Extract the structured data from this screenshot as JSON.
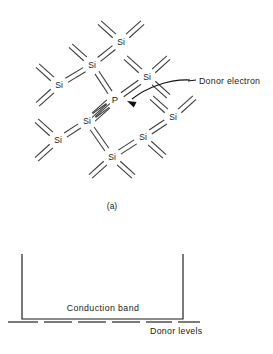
{
  "figure": {
    "panel_a": {
      "caption": "(a)",
      "caption_pos": {
        "x": 112,
        "y": 209
      },
      "annotation": {
        "label": "Donor electron",
        "text_pos": {
          "x": 199,
          "y": 84
        },
        "leader_line": {
          "x1": 188,
          "y1": 81,
          "x2": 196,
          "y2": 80
        },
        "arrow_path": "M 190 80 C 168 79 146 88 132 99",
        "arrow_tip": {
          "x": 127,
          "y": 101
        },
        "arrow_angle_deg": 205
      },
      "atoms": [
        {
          "id": "si-top",
          "label": "Si",
          "x": 121,
          "y": 42,
          "element": "silicon"
        },
        {
          "id": "si-upper-left",
          "label": "Si",
          "x": 92,
          "y": 65,
          "element": "silicon"
        },
        {
          "id": "si-left",
          "label": "Si",
          "x": 59,
          "y": 85,
          "element": "silicon"
        },
        {
          "id": "si-upper-right",
          "label": "Si",
          "x": 147,
          "y": 77,
          "element": "silicon"
        },
        {
          "id": "p-dopant",
          "label": "P",
          "x": 115,
          "y": 100,
          "element": "phosphorus"
        },
        {
          "id": "si-lower-left-inner",
          "label": "Si",
          "x": 87,
          "y": 121,
          "element": "silicon"
        },
        {
          "id": "si-far-left-lower",
          "label": "Si",
          "x": 58,
          "y": 140,
          "element": "silicon"
        },
        {
          "id": "si-lower-right-inner",
          "label": "Si",
          "x": 143,
          "y": 137,
          "element": "silicon"
        },
        {
          "id": "si-right-lower",
          "label": "Si",
          "x": 173,
          "y": 117,
          "element": "silicon"
        },
        {
          "id": "si-bottom",
          "label": "Si",
          "x": 112,
          "y": 157,
          "element": "silicon"
        }
      ],
      "bonds": [
        {
          "from": "si-upper-left",
          "to": "si-top",
          "kind": "covalent-pair"
        },
        {
          "from": "si-left",
          "to": "si-upper-left",
          "kind": "covalent-pair"
        },
        {
          "from": "si-upper-left",
          "to": "p-dopant",
          "kind": "covalent-pair"
        },
        {
          "from": "si-upper-right",
          "to": "p-dopant",
          "kind": "covalent-pair"
        },
        {
          "from": "p-dopant",
          "to": "si-lower-left-inner",
          "kind": "covalent-pair"
        },
        {
          "from": "si-lower-left-inner",
          "to": "si-far-left-lower",
          "kind": "covalent-pair"
        },
        {
          "from": "si-lower-left-inner",
          "to": "si-bottom",
          "kind": "covalent-pair"
        },
        {
          "from": "si-bottom",
          "to": "si-lower-right-inner",
          "kind": "covalent-pair"
        },
        {
          "from": "si-lower-right-inner",
          "to": "si-right-lower",
          "kind": "covalent-pair"
        }
      ],
      "dangling_bonds": [
        {
          "atom": "si-top",
          "dir": "nw"
        },
        {
          "atom": "si-top",
          "dir": "ne"
        },
        {
          "atom": "si-upper-left",
          "dir": "nw"
        },
        {
          "atom": "si-left",
          "dir": "nw"
        },
        {
          "atom": "si-left",
          "dir": "sw"
        },
        {
          "atom": "si-upper-right",
          "dir": "nw"
        },
        {
          "atom": "si-upper-right",
          "dir": "ne"
        },
        {
          "atom": "si-upper-right",
          "dir": "se"
        },
        {
          "atom": "p-dopant",
          "dir": "sw"
        },
        {
          "atom": "si-far-left-lower",
          "dir": "nw"
        },
        {
          "atom": "si-far-left-lower",
          "dir": "sw"
        },
        {
          "atom": "si-lower-left-inner",
          "dir": "ne"
        },
        {
          "atom": "si-right-lower",
          "dir": "nw"
        },
        {
          "atom": "si-right-lower",
          "dir": "ne"
        },
        {
          "atom": "si-lower-right-inner",
          "dir": "se"
        },
        {
          "atom": "si-bottom",
          "dir": "sw"
        },
        {
          "atom": "si-bottom",
          "dir": "se"
        }
      ],
      "bond_style": {
        "pair_offset": 2.4,
        "gap_from_atom": 9,
        "dangling_length": 20
      }
    },
    "panel_b": {
      "conduction_band": {
        "label": "Conduction band",
        "label_pos": {
          "x": 103,
          "y": 311
        },
        "left_edge_x": 22,
        "right_edge_x": 183,
        "top_y": 254,
        "bottom_y": 319
      },
      "donor_levels": {
        "label": "Donor levels",
        "label_pos": {
          "x": 150,
          "y": 334
        },
        "line_y": 322,
        "dashes": [
          {
            "x1": 8,
            "x2": 38
          },
          {
            "x1": 44,
            "x2": 72
          },
          {
            "x1": 78,
            "x2": 106
          },
          {
            "x1": 112,
            "x2": 140
          },
          {
            "x1": 146,
            "x2": 172
          },
          {
            "x1": 178,
            "x2": 200
          }
        ]
      }
    }
  }
}
